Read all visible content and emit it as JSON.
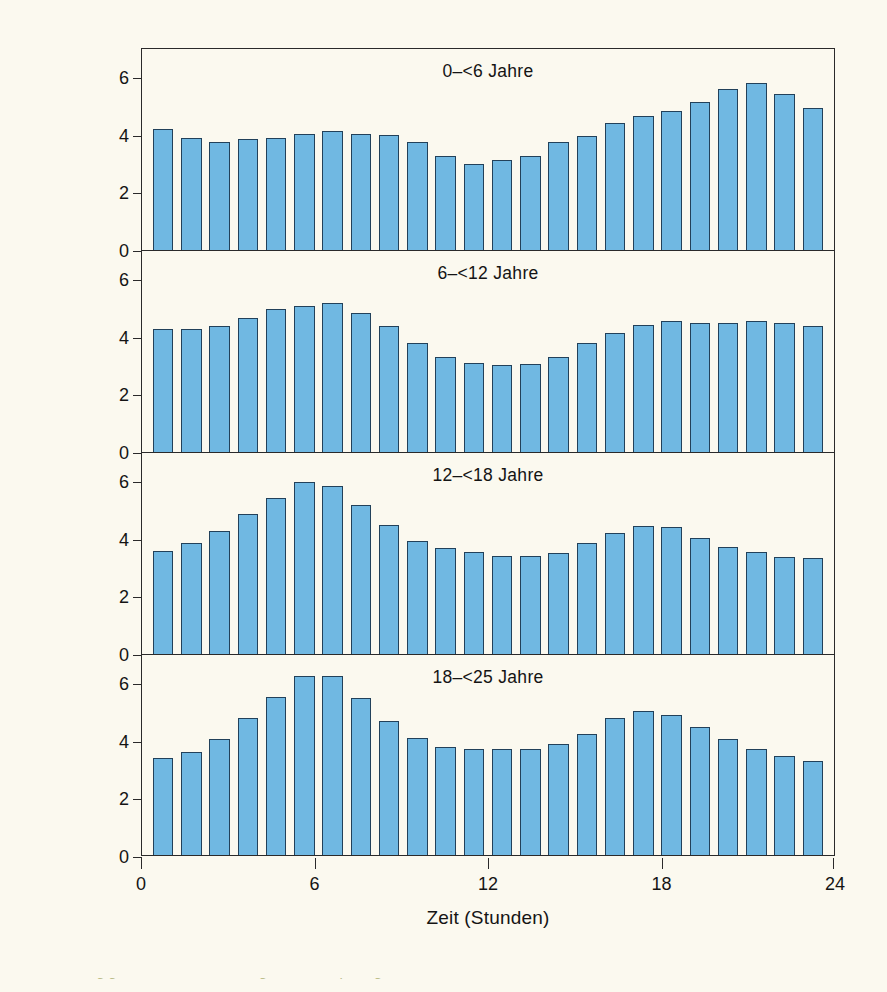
{
  "figure": {
    "background_color": "#fbf9ef",
    "bar_color": "#70b8e2",
    "bar_edge_color": "#22415a",
    "axis_color": "#2a2a2a",
    "xlabel": "Zeit (Stunden)",
    "ylabel": "Stündliche Verteilung der Basalrate (%)",
    "yticks": [
      "0",
      "2",
      "4",
      "6"
    ],
    "xticks": [
      "0",
      "6",
      "12",
      "18",
      "24"
    ],
    "caption_partial": "Altersabhängige Basalraten ... bezogen auf die pro kg ... Insulindosis ..."
  },
  "chart_data": {
    "type": "bar",
    "title": "",
    "xlabel": "Zeit (Stunden)",
    "ylabel": "Stündliche Verteilung der Basalrate (%)",
    "xlim": [
      0,
      24
    ],
    "ylim": [
      0,
      7
    ],
    "yticks": [
      0,
      2,
      4,
      6
    ],
    "xticks": [
      0,
      6,
      12,
      18,
      24
    ],
    "grid": false,
    "legend": "none",
    "x": [
      0,
      1,
      2,
      3,
      4,
      5,
      6,
      7,
      8,
      9,
      10,
      11,
      12,
      13,
      14,
      15,
      16,
      17,
      18,
      19,
      20,
      21,
      22,
      23
    ],
    "panels": [
      {
        "title": "0–<6 Jahre",
        "values": [
          4.2,
          3.9,
          3.75,
          3.88,
          3.9,
          4.05,
          4.15,
          4.05,
          4.0,
          3.75,
          3.28,
          2.98,
          3.15,
          3.28,
          3.75,
          3.98,
          4.42,
          4.65,
          4.85,
          5.15,
          5.62,
          5.8,
          5.42,
          4.95
        ]
      },
      {
        "title": "6–<12 Jahre",
        "values": [
          4.28,
          4.3,
          4.38,
          4.65,
          4.98,
          5.1,
          5.18,
          4.85,
          4.38,
          3.8,
          3.32,
          3.1,
          3.02,
          3.08,
          3.32,
          3.78,
          4.15,
          4.42,
          4.55,
          4.48,
          4.48,
          4.55,
          4.48,
          4.38
        ]
      },
      {
        "title": "12–<18 Jahre",
        "values": [
          3.6,
          3.85,
          4.28,
          4.88,
          5.45,
          6.0,
          5.85,
          5.18,
          4.5,
          3.95,
          3.7,
          3.55,
          3.42,
          3.42,
          3.52,
          3.88,
          4.22,
          4.45,
          4.42,
          4.05,
          3.72,
          3.55,
          3.38,
          3.35
        ]
      },
      {
        "title": "18–<25 Jahre",
        "values": [
          3.4,
          3.6,
          4.05,
          4.78,
          5.52,
          6.28,
          6.28,
          5.48,
          4.68,
          4.1,
          3.78,
          3.72,
          3.7,
          3.7,
          3.88,
          4.25,
          4.78,
          5.05,
          4.9,
          4.48,
          4.05,
          3.7,
          3.45,
          3.28
        ]
      }
    ]
  }
}
